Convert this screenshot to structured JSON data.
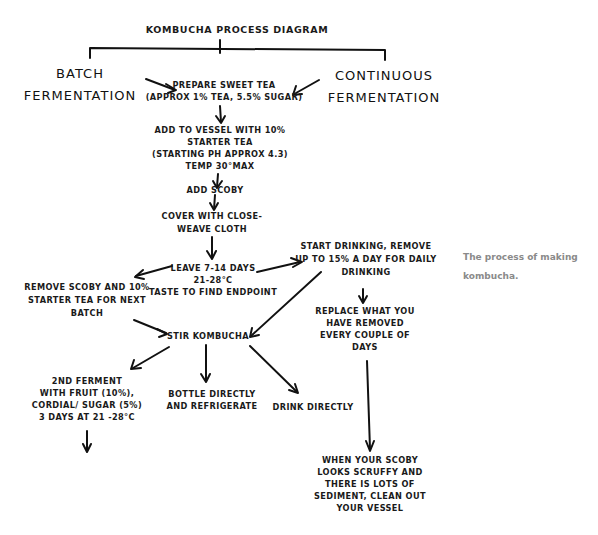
{
  "diagram": {
    "title": "Kombucha Process Diagram",
    "branches": {
      "batch": [
        "Batch",
        "Fermentation"
      ],
      "continuous": [
        "Continuous",
        "Fermentation"
      ]
    },
    "nodes": {
      "prepare_tea": [
        "Prepare sweet tea",
        "(approx 1% tea, 5.5% sugar)"
      ],
      "add_to_vessel": [
        "Add to vessel with 10%",
        "starter tea",
        "(starting pH approx 4.3)",
        "temp 30°max"
      ],
      "add_scoby": [
        "Add scoby"
      ],
      "cover": [
        "Cover with close-",
        "weave cloth"
      ],
      "leave": [
        "Leave 7-14 days",
        "21-28°C",
        "taste to find endpoint"
      ],
      "remove_scoby": [
        "Remove scoby and 10%",
        "starter tea for next",
        "batch"
      ],
      "start_drinking": [
        "Start drinking, remove",
        "up to 15% a day for daily",
        "drinking"
      ],
      "replace": [
        "Replace what you",
        "have removed",
        "every couple of",
        "days"
      ],
      "stir": [
        "Stir kombucha"
      ],
      "second_ferment": [
        "2nd ferment",
        "with fruit (10%),",
        "cordial/ sugar (5%)",
        "3 days at 21 -28°C"
      ],
      "bottle": [
        "Bottle directly",
        "and refrigerate"
      ],
      "drink": [
        "Drink directly"
      ],
      "clean": [
        "When your scoby",
        "looks scruffy and",
        "there is lots of",
        "sediment, clean out",
        "your vessel"
      ]
    },
    "edges": [
      {
        "from": "batch",
        "to": "prepare_tea"
      },
      {
        "from": "continuous",
        "to": "prepare_tea"
      },
      {
        "from": "prepare_tea",
        "to": "add_to_vessel"
      },
      {
        "from": "add_to_vessel",
        "to": "add_scoby"
      },
      {
        "from": "add_scoby",
        "to": "cover"
      },
      {
        "from": "cover",
        "to": "leave"
      },
      {
        "from": "leave",
        "to": "remove_scoby"
      },
      {
        "from": "leave",
        "to": "start_drinking"
      },
      {
        "from": "remove_scoby",
        "to": "stir"
      },
      {
        "from": "start_drinking",
        "to": "stir"
      },
      {
        "from": "start_drinking",
        "to": "replace"
      },
      {
        "from": "replace",
        "to": "clean"
      },
      {
        "from": "stir",
        "to": "second_ferment"
      },
      {
        "from": "stir",
        "to": "bottle"
      },
      {
        "from": "stir",
        "to": "drink"
      },
      {
        "from": "second_ferment",
        "to": "(continues)"
      }
    ]
  },
  "caption": [
    "The process of making",
    "kombucha."
  ]
}
